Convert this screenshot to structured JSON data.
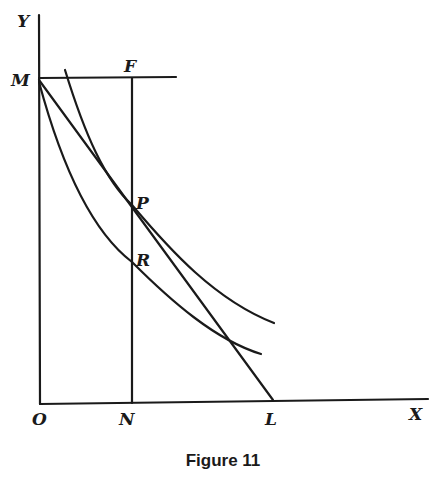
{
  "figure": {
    "caption": "Figure 11",
    "colors": {
      "ink": "#1a1a1a",
      "background": "#ffffff"
    },
    "axes": {
      "x_label": "X",
      "y_label": "Y",
      "origin_label": "O"
    },
    "points": {
      "M": "M",
      "F": "F",
      "P": "P",
      "R": "R",
      "N": "N",
      "L": "L"
    },
    "elements": [
      {
        "name": "y-axis",
        "from": "O",
        "to": "Y"
      },
      {
        "name": "x-axis",
        "from": "O",
        "to": "X"
      },
      {
        "name": "line-MF",
        "from": "M",
        "to": "F",
        "type": "horizontal"
      },
      {
        "name": "line-NF",
        "from": "N",
        "to": "F",
        "type": "vertical",
        "through": [
          "R",
          "P"
        ]
      },
      {
        "name": "line-ML",
        "from": "M",
        "to": "L",
        "type": "straight",
        "through": [
          "P"
        ]
      },
      {
        "name": "upper-curve",
        "type": "convex decreasing",
        "through": [
          "P"
        ],
        "tangent_to": "line-ML"
      },
      {
        "name": "lower-curve",
        "type": "convex decreasing",
        "from": "M",
        "through": [
          "R"
        ]
      }
    ]
  }
}
